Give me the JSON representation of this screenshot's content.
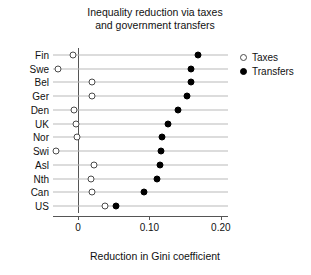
{
  "chart_data": {
    "type": "scatter",
    "title": "Inequality reduction via taxes and government transfers",
    "title_lines": [
      "Inequality reduction via taxes",
      "and government transfers"
    ],
    "xlabel": "Reduction in Gini coefficient",
    "ylabel": "",
    "xlim": [
      -0.035,
      0.21
    ],
    "xticks": [
      0,
      0.1,
      0.2
    ],
    "xtick_labels": [
      "0",
      "0.10",
      "0.20"
    ],
    "grid": "horizontal-row-lines",
    "legend_position": "right-top",
    "categories": [
      "Fin",
      "Swe",
      "Bel",
      "Ger",
      "Den",
      "UK",
      "Nor",
      "Swi",
      "Asl",
      "Nth",
      "Can",
      "US"
    ],
    "series": [
      {
        "name": "Taxes",
        "marker": "open-circle",
        "color": "#ffffff",
        "edge_color": "#4a4a4a",
        "values": [
          -0.007,
          -0.028,
          0.02,
          0.019,
          -0.006,
          -0.003,
          -0.002,
          -0.031,
          0.023,
          0.018,
          0.019,
          0.038
        ]
      },
      {
        "name": "Transfers",
        "marker": "filled-circle",
        "color": "#000000",
        "edge_color": "#000000",
        "values": [
          0.168,
          0.158,
          0.158,
          0.152,
          0.14,
          0.126,
          0.118,
          0.116,
          0.115,
          0.11,
          0.092,
          0.053
        ]
      }
    ]
  },
  "legend": {
    "items": [
      {
        "label": "Taxes",
        "marker": "open-circle"
      },
      {
        "label": "Transfers",
        "marker": "filled-circle"
      }
    ]
  }
}
